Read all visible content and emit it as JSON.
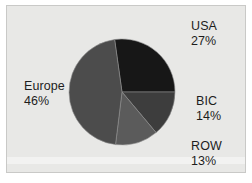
{
  "chart_data": {
    "type": "pie",
    "title": "",
    "subtitle": "",
    "xlabel": "",
    "ylabel": "",
    "legend_position": "outside-labels",
    "grid": false,
    "total_percent": 100,
    "categories": [
      "USA",
      "BIC",
      "ROW",
      "Europe"
    ],
    "values": [
      27,
      14,
      13,
      46
    ],
    "slices": [
      {
        "name": "USA",
        "label": "USA",
        "value": 27,
        "value_label": "27%",
        "color": "#171717",
        "start_angle_deg": 352,
        "end_angle_deg": 90,
        "label_position": "top-right"
      },
      {
        "name": "BIC",
        "label": "BIC",
        "value": 14,
        "value_label": "14%",
        "color": "#3d3d3d",
        "start_angle_deg": 90,
        "end_angle_deg": 140,
        "label_position": "mid-right"
      },
      {
        "name": "ROW",
        "label": "ROW",
        "value": 13,
        "value_label": "13%",
        "color": "#5b5b5b",
        "start_angle_deg": 140,
        "end_angle_deg": 187,
        "label_position": "bottom-right"
      },
      {
        "name": "Europe",
        "label": "Europe",
        "value": 46,
        "value_label": "46%",
        "color": "#4c4c4c",
        "start_angle_deg": 187,
        "end_angle_deg": 352,
        "label_position": "left"
      }
    ],
    "geometry": {
      "center_x": 122,
      "center_y": 92,
      "radius": 53
    },
    "colors": {
      "background": "#e8e8e6",
      "panel_border": "#c9c9c7",
      "page_background": "#ffffff",
      "text": "#1d1d1d",
      "slice_separator": "#8f8f8f"
    }
  }
}
